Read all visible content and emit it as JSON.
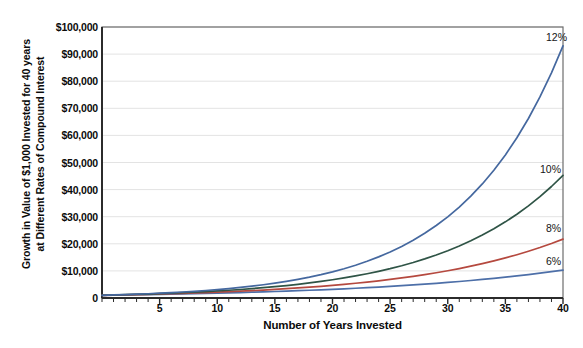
{
  "chart_data": {
    "type": "line",
    "title": "",
    "ylabel": "Growth in Value of $1,000 Invested for 40 years at Different Rates of Compound Interest",
    "ylabel_line1": "Growth in Value of $1,000 Invested for 40 years",
    "ylabel_line2": "at Different Rates of Compound Interest",
    "xlabel": "Number of Years Invested",
    "xlim": [
      0,
      40
    ],
    "ylim": [
      0,
      100000
    ],
    "grid": true,
    "legend_position": "inline-right-end-labels",
    "y_tick_labels": [
      "0",
      "$10,000",
      "$20,000",
      "$30,000",
      "$40,000",
      "$50,000",
      "$60,000",
      "$70,000",
      "$80,000",
      "$90,000",
      "$100,000"
    ],
    "y_tick_values": [
      0,
      10000,
      20000,
      30000,
      40000,
      50000,
      60000,
      70000,
      80000,
      90000,
      100000
    ],
    "x_tick_labels": [
      "5",
      "10",
      "15",
      "20",
      "25",
      "30",
      "35",
      "40"
    ],
    "x_tick_values": [
      5,
      10,
      15,
      20,
      25,
      30,
      35,
      40
    ],
    "x_minor_tick_interval": 1,
    "x": [
      0,
      1,
      2,
      3,
      4,
      5,
      6,
      7,
      8,
      9,
      10,
      11,
      12,
      13,
      14,
      15,
      16,
      17,
      18,
      19,
      20,
      21,
      22,
      23,
      24,
      25,
      26,
      27,
      28,
      29,
      30,
      31,
      32,
      33,
      34,
      35,
      36,
      37,
      38,
      39,
      40
    ],
    "series": [
      {
        "name": "6%",
        "label": "6%",
        "rate": 0.06,
        "color": "#4d6fa8",
        "final_value": 10286,
        "values": [
          1000,
          1060,
          1124,
          1191,
          1262,
          1338,
          1419,
          1504,
          1594,
          1689,
          1791,
          1898,
          2012,
          2133,
          2261,
          2397,
          2540,
          2693,
          2854,
          3026,
          3207,
          3400,
          3604,
          3820,
          4049,
          4292,
          4549,
          4822,
          5112,
          5418,
          5743,
          6088,
          6453,
          6841,
          7251,
          7686,
          8147,
          8636,
          9154,
          9704,
          10286
        ]
      },
      {
        "name": "8%",
        "label": "8%",
        "rate": 0.08,
        "color": "#b5493f",
        "final_value": 21725,
        "values": [
          1000,
          1080,
          1166,
          1260,
          1360,
          1469,
          1587,
          1714,
          1851,
          1999,
          2159,
          2332,
          2518,
          2720,
          2937,
          3172,
          3426,
          3700,
          3996,
          4316,
          4661,
          5034,
          5437,
          5871,
          6341,
          6848,
          7396,
          7988,
          8627,
          9317,
          10063,
          10868,
          11737,
          12676,
          13690,
          14785,
          15968,
          17246,
          18625,
          20115,
          21725
        ]
      },
      {
        "name": "10%",
        "label": "10%",
        "rate": 0.1,
        "color": "#2f5446",
        "final_value": 45259,
        "values": [
          1000,
          1100,
          1210,
          1331,
          1464,
          1611,
          1772,
          1949,
          2144,
          2358,
          2594,
          2853,
          3138,
          3452,
          3797,
          4177,
          4595,
          5054,
          5560,
          6116,
          6727,
          7400,
          8140,
          8954,
          9850,
          10835,
          11918,
          13110,
          14421,
          15863,
          17449,
          19194,
          21114,
          23225,
          25548,
          28102,
          30913,
          34004,
          37404,
          41145,
          45259
        ]
      },
      {
        "name": "12%",
        "label": "12%",
        "rate": 0.12,
        "color": "#45689f",
        "final_value": 93051,
        "values": [
          1000,
          1120,
          1254,
          1405,
          1574,
          1762,
          1974,
          2211,
          2476,
          2773,
          3106,
          3479,
          3896,
          4363,
          4887,
          5474,
          6130,
          6866,
          7690,
          8613,
          9646,
          10804,
          12100,
          13552,
          15179,
          17000,
          19040,
          21325,
          23884,
          26750,
          29960,
          33555,
          37582,
          42092,
          47143,
          52800,
          59136,
          66232,
          74180,
          83081,
          93051
        ]
      }
    ],
    "series_label_positions": [
      {
        "label": "12%",
        "x": 546,
        "y": 31
      },
      {
        "label": "10%",
        "x": 540,
        "y": 163
      },
      {
        "label": "8%",
        "x": 546,
        "y": 222
      },
      {
        "label": "6%",
        "x": 546,
        "y": 255
      }
    ]
  }
}
